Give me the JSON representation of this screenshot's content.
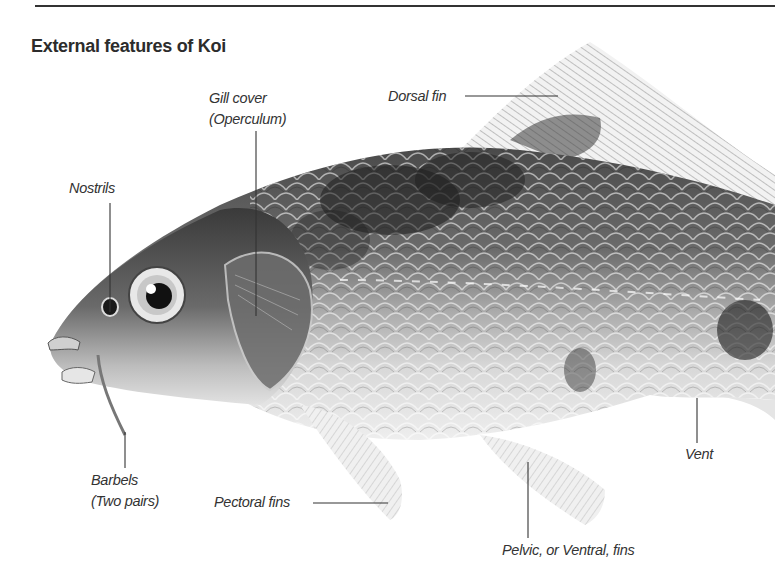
{
  "figure": {
    "title": "External features of Koi",
    "colors": {
      "ink": "#2a2a2a",
      "rule": "#333333",
      "background": "#ffffff"
    }
  },
  "labels": {
    "gill_cover": {
      "line1": "Gill cover",
      "line2": "(Operculum)"
    },
    "dorsal_fin": {
      "line1": "Dorsal fin"
    },
    "nostrils": {
      "line1": "Nostrils"
    },
    "barbels": {
      "line1": "Barbels",
      "line2": "(Two pairs)"
    },
    "pectoral_fins": {
      "line1": "Pectoral fins"
    },
    "vent": {
      "line1": "Vent"
    },
    "pelvic_fins": {
      "line1": "Pelvic, or Ventral, fins"
    }
  }
}
